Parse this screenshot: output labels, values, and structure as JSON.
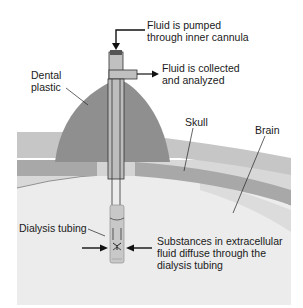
{
  "diagram": {
    "labels": {
      "pumped_line1": "Fluid is pumped",
      "pumped_line2": "through inner cannula",
      "collected_line1": "Fluid is collected",
      "collected_line2": "and analyzed",
      "dental_line1": "Dental",
      "dental_line2": "plastic",
      "skull": "Skull",
      "brain": "Brain",
      "dialysis_tubing": "Dialysis tubing",
      "substances_line1": "Substances in extracellular",
      "substances_line2": "fluid diffuse through the",
      "substances_line3": "dialysis tubing"
    },
    "colors": {
      "dental_plastic": "#8f8f8f",
      "skull_outer": "#c4c4c4",
      "skull_band": "#a6a6a6",
      "meninges": "#d6d6d6",
      "brain": "#ebebeb",
      "probe": "#b8b8b8",
      "line": "#1a1a1a"
    }
  }
}
